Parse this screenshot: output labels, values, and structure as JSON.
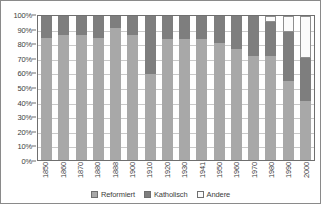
{
  "chart_data": {
    "type": "bar",
    "subtype": "stacked-100-percent",
    "title": "",
    "xlabel": "",
    "ylabel": "",
    "ylim": [
      0,
      100
    ],
    "y_tick_labels": [
      "100%",
      "90%",
      "80%",
      "70%",
      "60%",
      "50%",
      "40%",
      "30%",
      "20%",
      "10%",
      "0%"
    ],
    "y_tick_values": [
      100,
      90,
      80,
      70,
      60,
      50,
      40,
      30,
      20,
      10,
      0
    ],
    "grid": true,
    "legend_position": "bottom",
    "categories": [
      "1850",
      "1860",
      "1870",
      "1880",
      "1888",
      "1900",
      "1910",
      "1920",
      "1930",
      "1941",
      "1950",
      "1960",
      "1970",
      "1980",
      "1990",
      "2000"
    ],
    "series": [
      {
        "name": "Reformiert",
        "color": "#a8a8a8",
        "values": [
          85,
          87,
          87,
          85,
          92,
          87,
          60,
          84,
          84,
          84,
          81,
          77,
          72,
          72,
          55,
          41
        ]
      },
      {
        "name": "Katholisch",
        "color": "#7e7e7e",
        "values": [
          15,
          13,
          13,
          15,
          8,
          13,
          40,
          16,
          16,
          16,
          19,
          23,
          28,
          24,
          34,
          30
        ]
      },
      {
        "name": "Andere",
        "color": "#fbfbfb",
        "values": [
          0,
          0,
          0,
          0,
          0,
          0,
          0,
          0,
          0,
          0,
          0,
          0,
          0,
          4,
          11,
          29
        ]
      }
    ]
  },
  "legend": {
    "items": [
      {
        "label": "Reformiert",
        "color": "#a8a8a8"
      },
      {
        "label": "Katholisch",
        "color": "#7e7e7e"
      },
      {
        "label": "Andere",
        "color": "#fbfbfb"
      }
    ]
  }
}
